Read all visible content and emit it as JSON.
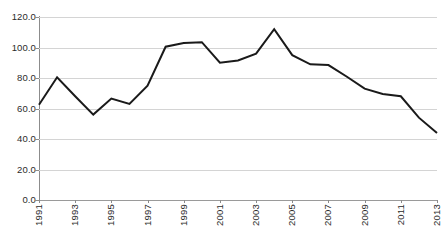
{
  "chart_data": {
    "type": "line",
    "title": "",
    "subtitle": "",
    "xlabel": "",
    "ylabel": "",
    "x": [
      1991,
      1992,
      1993,
      1994,
      1995,
      1996,
      1997,
      1998,
      1999,
      2000,
      2001,
      2002,
      2003,
      2004,
      2005,
      2006,
      2007,
      2008,
      2009,
      2010,
      2011,
      2012,
      2013
    ],
    "categories": [
      "1991",
      "1992",
      "1993",
      "1994",
      "1995",
      "1996",
      "1997",
      "1998",
      "1999",
      "2000",
      "2001",
      "2002",
      "2003",
      "2004",
      "2005",
      "2006",
      "2007",
      "2008",
      "2009",
      "2010",
      "2011",
      "2012",
      "2013"
    ],
    "values": [
      62.5,
      80.5,
      68.0,
      56.0,
      66.5,
      63.0,
      75.0,
      100.5,
      103.0,
      103.5,
      90.0,
      91.5,
      96.0,
      112.0,
      95.0,
      89.0,
      88.5,
      81.0,
      73.0,
      69.5,
      68.0,
      54.0,
      44.0
    ],
    "series": [
      {
        "name": "",
        "color": "#1a1a1a",
        "values": [
          62.5,
          80.5,
          68.0,
          56.0,
          66.5,
          63.0,
          75.0,
          100.5,
          103.0,
          103.5,
          90.0,
          91.5,
          96.0,
          112.0,
          95.0,
          89.0,
          88.5,
          81.0,
          73.0,
          69.5,
          68.0,
          54.0,
          44.0
        ]
      }
    ],
    "ylim": [
      0.0,
      120.0
    ],
    "y_ticks": [
      0.0,
      20.0,
      40.0,
      60.0,
      80.0,
      100.0,
      120.0
    ],
    "y_tick_labels": [
      "0.0",
      "20.0",
      "40.0",
      "60.0",
      "80.0",
      "100.0",
      "120.0"
    ],
    "x_tick_years": [
      1991,
      1993,
      1995,
      1997,
      1999,
      2001,
      2003,
      2005,
      2007,
      2009,
      2011,
      2013
    ],
    "x_tick_labels": [
      "1991",
      "1993",
      "1995",
      "1997",
      "1999",
      "2001",
      "2003",
      "2005",
      "2007",
      "2009",
      "2011",
      "2013"
    ],
    "xlim": [
      1991,
      2013
    ],
    "grid": true,
    "grid_axis": "y",
    "legend": false,
    "legend_position": "none",
    "annotations": [],
    "colors": {
      "line": "#1a1a1a",
      "gridline": "#d4d4d4",
      "axis": "#8c8c8c",
      "text": "#2b2b2b",
      "background": "#ffffff"
    }
  }
}
